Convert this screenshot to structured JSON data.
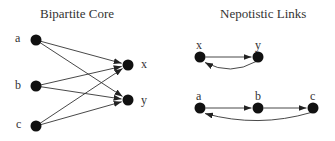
{
  "left_panel": {
    "title": "Bipartite Core",
    "sources": [
      {
        "id": "a",
        "label": "a",
        "x": 36,
        "y": 40
      },
      {
        "id": "b",
        "label": "b",
        "x": 36,
        "y": 86
      },
      {
        "id": "c",
        "label": "c",
        "x": 36,
        "y": 126
      }
    ],
    "targets": [
      {
        "id": "x",
        "label": "x",
        "x": 128,
        "y": 65
      },
      {
        "id": "y",
        "label": "y",
        "x": 128,
        "y": 100
      }
    ],
    "edges": [
      [
        "a",
        "x"
      ],
      [
        "a",
        "y"
      ],
      [
        "b",
        "x"
      ],
      [
        "b",
        "y"
      ],
      [
        "c",
        "x"
      ],
      [
        "c",
        "y"
      ]
    ]
  },
  "right_panel": {
    "title": "Nepotistic Links",
    "pair": {
      "nodes": [
        {
          "id": "x",
          "label": "x",
          "x": 200,
          "y": 57
        },
        {
          "id": "y",
          "label": "y",
          "x": 258,
          "y": 57
        }
      ],
      "edges": [
        [
          "x",
          "y",
          "straight"
        ],
        [
          "y",
          "x",
          "curved"
        ]
      ]
    },
    "chain": {
      "nodes": [
        {
          "id": "a",
          "label": "a",
          "x": 200,
          "y": 108
        },
        {
          "id": "b",
          "label": "b",
          "x": 258,
          "y": 108
        },
        {
          "id": "c",
          "label": "c",
          "x": 313,
          "y": 108
        }
      ],
      "edges": [
        [
          "a",
          "b",
          "straight"
        ],
        [
          "b",
          "c",
          "straight"
        ],
        [
          "c",
          "a",
          "curved"
        ]
      ]
    }
  }
}
